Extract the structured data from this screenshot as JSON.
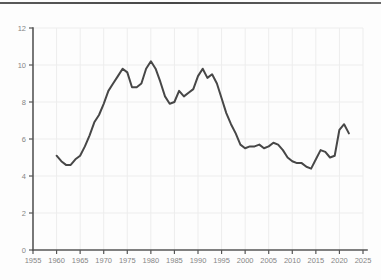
{
  "page": {
    "background": "#fdfdfd",
    "top_rule_color": "#4f4f4f"
  },
  "chart_data": {
    "type": "line",
    "title": "",
    "xlabel": "",
    "ylabel": "",
    "xlim": [
      1955,
      2027
    ],
    "ylim": [
      0,
      12
    ],
    "x_ticks": [
      1955,
      1960,
      1965,
      1970,
      1975,
      1980,
      1985,
      1990,
      1995,
      2000,
      2005,
      2010,
      2015,
      2020,
      2025
    ],
    "y_ticks": [
      0,
      2,
      4,
      6,
      8,
      10,
      12
    ],
    "grid": true,
    "legend_position": "none",
    "line_color": "#474747",
    "axis_color": "#565656",
    "grid_color": "#ededed",
    "tick_label_color": "#858585",
    "series": [
      {
        "name": "rate",
        "x": [
          1960,
          1961,
          1962,
          1963,
          1964,
          1965,
          1966,
          1967,
          1968,
          1969,
          1970,
          1971,
          1972,
          1973,
          1974,
          1975,
          1976,
          1977,
          1978,
          1979,
          1980,
          1981,
          1982,
          1983,
          1984,
          1985,
          1986,
          1987,
          1988,
          1989,
          1990,
          1991,
          1992,
          1993,
          1994,
          1995,
          1996,
          1997,
          1998,
          1999,
          2000,
          2001,
          2002,
          2003,
          2004,
          2005,
          2006,
          2007,
          2008,
          2009,
          2010,
          2011,
          2012,
          2013,
          2014,
          2015,
          2016,
          2017,
          2018,
          2019,
          2020,
          2021,
          2022
        ],
        "values": [
          5.1,
          4.8,
          4.6,
          4.6,
          4.9,
          5.1,
          5.6,
          6.2,
          6.9,
          7.3,
          7.9,
          8.6,
          9.0,
          9.4,
          9.8,
          9.6,
          8.8,
          8.8,
          9.0,
          9.8,
          10.2,
          9.8,
          9.1,
          8.3,
          7.9,
          8.0,
          8.6,
          8.3,
          8.5,
          8.7,
          9.4,
          9.8,
          9.3,
          9.5,
          9.0,
          8.2,
          7.4,
          6.8,
          6.3,
          5.7,
          5.5,
          5.6,
          5.6,
          5.7,
          5.5,
          5.6,
          5.8,
          5.7,
          5.4,
          5.0,
          4.8,
          4.7,
          4.7,
          4.5,
          4.4,
          4.9,
          5.4,
          5.3,
          5.0,
          5.1,
          6.5,
          6.8,
          6.3
        ]
      }
    ]
  }
}
